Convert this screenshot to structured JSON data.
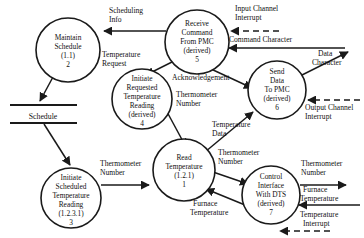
{
  "diagram": {
    "processes": [
      {
        "id": "p2",
        "name": "maintain-schedule",
        "lines": [
          "Maintain",
          "Schedule",
          "(1.1)",
          "2"
        ],
        "number": "2",
        "ref": "(1.1)"
      },
      {
        "id": "p5",
        "name": "receive-command-from-pmc",
        "lines": [
          "Receive",
          "Command",
          "From PMC",
          "(derived)",
          "5"
        ],
        "number": "5",
        "ref": "(derived)"
      },
      {
        "id": "p4",
        "name": "initiate-requested-temperature-reading",
        "lines": [
          "Initiate",
          "Requested",
          "Temperature",
          "Reading",
          "(derived)",
          "4"
        ],
        "number": "4",
        "ref": "(derived)"
      },
      {
        "id": "p6",
        "name": "send-data-to-pmc",
        "lines": [
          "Send",
          "Data",
          "To PMC",
          "(derived)",
          "6"
        ],
        "number": "6",
        "ref": "(derived)"
      },
      {
        "id": "p3",
        "name": "initiate-scheduled-temperature-reading",
        "lines": [
          "Initiate",
          "Scheduled",
          "Temperature",
          "Reading",
          "(1.2.3.1)",
          "3"
        ],
        "number": "3",
        "ref": "(1.2.3.1)"
      },
      {
        "id": "p1",
        "name": "read-temperature",
        "lines": [
          "Read",
          "Temperature",
          "(1.2.1)",
          "1"
        ],
        "number": "1",
        "ref": "(1.2.1)"
      },
      {
        "id": "p7",
        "name": "control-interface-with-dts",
        "lines": [
          "Control",
          "Interface",
          "With DTS",
          "(derived)",
          "7"
        ],
        "number": "7",
        "ref": "(derived)"
      }
    ],
    "datastores": [
      {
        "id": "ds1",
        "name": "schedule-store",
        "label": "Schedule"
      }
    ],
    "flows": [
      {
        "id": "f1",
        "name": "flow-scheduling-info",
        "lines": [
          "Scheduling",
          "Info"
        ],
        "style": "solid"
      },
      {
        "id": "f2",
        "name": "flow-temperature-request",
        "lines": [
          "Temperature",
          "Request"
        ],
        "style": "solid"
      },
      {
        "id": "f3",
        "name": "flow-input-channel-interrupt",
        "lines": [
          "Input Channel",
          "Interrupt"
        ],
        "style": "dashed"
      },
      {
        "id": "f4",
        "name": "flow-command-character",
        "lines": [
          "Command Character"
        ],
        "style": "solid"
      },
      {
        "id": "f5",
        "name": "flow-acknowledgement",
        "lines": [
          "Acknowledgement"
        ],
        "style": "solid"
      },
      {
        "id": "f6",
        "name": "flow-data-character",
        "lines": [
          "Data",
          "Character"
        ],
        "style": "solid"
      },
      {
        "id": "f7",
        "name": "flow-output-channel-interrupt",
        "lines": [
          "Output Channel",
          "Interrupt"
        ],
        "style": "dashed"
      },
      {
        "id": "f8",
        "name": "flow-thermometer-number-p4",
        "lines": [
          "Thermometer",
          "Number"
        ],
        "style": "solid"
      },
      {
        "id": "f9",
        "name": "flow-temperature-data",
        "lines": [
          "Temperature",
          "Data"
        ],
        "style": "solid"
      },
      {
        "id": "f10",
        "name": "flow-thermometer-number-p3",
        "lines": [
          "Thermometer",
          "Number"
        ],
        "style": "solid"
      },
      {
        "id": "f11",
        "name": "flow-thermometer-number-p7",
        "lines": [
          "Thermometer",
          "Number"
        ],
        "style": "solid"
      },
      {
        "id": "f12",
        "name": "flow-furnace-temperature-p7",
        "lines": [
          "Furnace",
          "Temperature"
        ],
        "style": "solid"
      },
      {
        "id": "f13",
        "name": "flow-thermometer-number-out",
        "lines": [
          "Thermometer",
          "Number"
        ],
        "style": "solid"
      },
      {
        "id": "f14",
        "name": "flow-furnace-temperature-in",
        "lines": [
          "Furnace",
          "Temperature"
        ],
        "style": "solid"
      },
      {
        "id": "f15",
        "name": "flow-temperature-interrupt",
        "lines": [
          "Temperature",
          "Interrupt"
        ],
        "style": "dashed"
      }
    ],
    "colors": {
      "stroke": "#1a1a1a",
      "text": "#111111",
      "background": "#ffffff"
    }
  }
}
